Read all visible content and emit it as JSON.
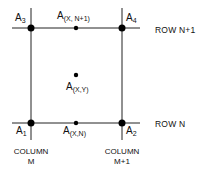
{
  "diagram": {
    "points": {
      "A3": {
        "base": "A",
        "sub": "3"
      },
      "A4": {
        "base": "A",
        "sub": "4"
      },
      "A1": {
        "base": "A",
        "sub": "1"
      },
      "A2": {
        "base": "A",
        "sub": "2"
      },
      "top_mid": {
        "base": "A",
        "sub": "(X, N+1)"
      },
      "center": {
        "base": "A",
        "sub": "(X,Y)"
      },
      "bottom_mid": {
        "base": "A",
        "sub": "(X,N)"
      }
    },
    "rows": {
      "top": "ROW N+1",
      "bottom": "ROW N"
    },
    "columns": {
      "left": {
        "line1": "COLUMN",
        "line2": "M"
      },
      "right": {
        "line1": "COLUMN",
        "line2": "M+1"
      }
    },
    "colors": {
      "line": "#222222",
      "dot": "#000000",
      "background": "#ffffff"
    }
  }
}
